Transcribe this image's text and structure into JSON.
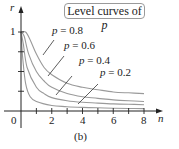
{
  "chart_data": {
    "type": "line",
    "title": "Level curves of p",
    "caption": "(b)",
    "xlabel": "n",
    "ylabel": "r",
    "xlim": [
      0,
      8
    ],
    "ylim": [
      0,
      1
    ],
    "x_ticks": [
      1,
      2,
      3,
      4,
      5,
      6,
      7,
      8
    ],
    "x_tick_labels": [
      "0",
      "2",
      "4",
      "6",
      "8"
    ],
    "y_ticks": [
      0.25,
      0.5,
      0.75,
      1
    ],
    "y_tick_labels": [
      "1"
    ],
    "grid": false,
    "data_note": "Point values are estimates read off the rendered curves; the generating formula is not shown in the figure.",
    "series": [
      {
        "name": "p = 0.8",
        "points": [
          [
            0,
            1
          ],
          [
            0.3,
            1
          ],
          [
            0.6,
            0.9
          ],
          [
            1,
            0.72
          ],
          [
            1.5,
            0.55
          ],
          [
            2,
            0.46
          ],
          [
            3,
            0.35
          ],
          [
            4,
            0.3
          ],
          [
            5,
            0.27
          ],
          [
            6,
            0.24
          ],
          [
            7,
            0.23
          ],
          [
            8,
            0.22
          ]
        ]
      },
      {
        "name": "p = 0.6",
        "points": [
          [
            0,
            1
          ],
          [
            0.2,
            0.95
          ],
          [
            0.5,
            0.72
          ],
          [
            1,
            0.5
          ],
          [
            1.5,
            0.38
          ],
          [
            2,
            0.3
          ],
          [
            3,
            0.22
          ],
          [
            4,
            0.18
          ],
          [
            5,
            0.16
          ],
          [
            6,
            0.14
          ],
          [
            7,
            0.13
          ],
          [
            8,
            0.12
          ]
        ]
      },
      {
        "name": "p = 0.4",
        "points": [
          [
            0,
            1
          ],
          [
            0.15,
            0.85
          ],
          [
            0.4,
            0.55
          ],
          [
            1,
            0.3
          ],
          [
            1.5,
            0.22
          ],
          [
            2,
            0.17
          ],
          [
            3,
            0.13
          ],
          [
            4,
            0.11
          ],
          [
            5,
            0.1
          ],
          [
            6,
            0.09
          ],
          [
            7,
            0.085
          ],
          [
            8,
            0.08
          ]
        ]
      },
      {
        "name": "p = 0.2",
        "points": [
          [
            0,
            1
          ],
          [
            0.1,
            0.7
          ],
          [
            0.3,
            0.35
          ],
          [
            0.6,
            0.18
          ],
          [
            1,
            0.12
          ],
          [
            2,
            0.07
          ],
          [
            3,
            0.055
          ],
          [
            4,
            0.045
          ],
          [
            5,
            0.04
          ],
          [
            6,
            0.035
          ],
          [
            7,
            0.032
          ],
          [
            8,
            0.03
          ]
        ]
      }
    ]
  },
  "legend": {
    "text": "Level curves of ",
    "var": "p"
  },
  "labels": [
    {
      "text": "p = 0.8",
      "x": 52,
      "y": 33
    },
    {
      "text": "p = 0.6",
      "x": 64,
      "y": 48
    },
    {
      "text": "p = 0.4",
      "x": 79,
      "y": 63
    },
    {
      "text": "p = 0.2",
      "x": 100,
      "y": 75
    }
  ],
  "axis": {
    "x_name": "n",
    "y_name": "r",
    "origin": "0",
    "x_tick_text": [
      "2",
      "4",
      "6",
      "8"
    ],
    "y_tick_text": "1"
  },
  "caption": "(b)",
  "colors": {
    "curve": "#9a9a9a",
    "axis": "#222222",
    "text": "#222222",
    "leader": "#333333"
  }
}
